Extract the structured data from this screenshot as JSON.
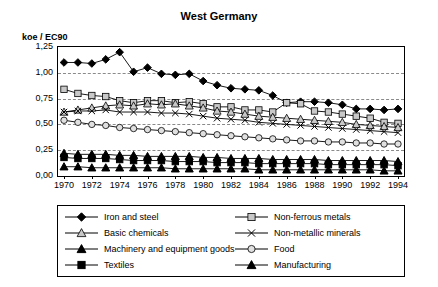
{
  "chart_data": {
    "type": "line",
    "title": "West Germany",
    "ylabel": "koe / EC90",
    "xlabel": "",
    "ylim": [
      0.0,
      1.25
    ],
    "yticks": [
      "0,00",
      "0,25",
      "0,50",
      "0,75",
      "1,00",
      "1,25"
    ],
    "ytick_values": [
      0.0,
      0.25,
      0.5,
      0.75,
      1.0,
      1.25
    ],
    "grid": true,
    "legend_position": "bottom",
    "x": [
      1970,
      1971,
      1972,
      1973,
      1974,
      1975,
      1976,
      1977,
      1978,
      1979,
      1980,
      1981,
      1982,
      1983,
      1984,
      1985,
      1986,
      1987,
      1988,
      1989,
      1990,
      1991,
      1992,
      1993,
      1994
    ],
    "xticks": [
      "1970",
      "1972",
      "1974",
      "1976",
      "1978",
      "1980",
      "1982",
      "1984",
      "1986",
      "1988",
      "1990",
      "1992",
      "1994"
    ],
    "series": [
      {
        "name": "Iron and steel",
        "marker": "diamond",
        "values": [
          1.1,
          1.1,
          1.09,
          1.13,
          1.2,
          1.01,
          1.05,
          0.99,
          0.98,
          0.99,
          0.92,
          0.88,
          0.85,
          0.84,
          0.83,
          0.78,
          0.71,
          0.72,
          0.72,
          0.71,
          0.69,
          0.65,
          0.65,
          0.64,
          0.65
        ]
      },
      {
        "name": "Non-ferrous metals",
        "marker": "square-light",
        "values": [
          0.84,
          0.8,
          0.78,
          0.77,
          0.73,
          0.71,
          0.73,
          0.73,
          0.71,
          0.72,
          0.7,
          0.67,
          0.67,
          0.64,
          0.64,
          0.62,
          0.71,
          0.7,
          0.63,
          0.62,
          0.6,
          0.58,
          0.56,
          0.52,
          0.51
        ]
      },
      {
        "name": "Basic chemicals",
        "marker": "triangle-light",
        "values": [
          0.62,
          0.64,
          0.66,
          0.68,
          0.69,
          0.68,
          0.7,
          0.69,
          0.7,
          0.68,
          0.66,
          0.63,
          0.62,
          0.6,
          0.58,
          0.57,
          0.56,
          0.55,
          0.54,
          0.53,
          0.52,
          0.5,
          0.49,
          0.48,
          0.47
        ]
      },
      {
        "name": "Non-metallic minerals",
        "marker": "x-cross",
        "values": [
          0.62,
          0.63,
          0.63,
          0.64,
          0.62,
          0.62,
          0.62,
          0.61,
          0.61,
          0.6,
          0.58,
          0.56,
          0.55,
          0.54,
          0.52,
          0.51,
          0.5,
          0.49,
          0.48,
          0.47,
          0.46,
          0.45,
          0.44,
          0.43,
          0.42
        ]
      },
      {
        "name": "Machinery and equipment goods",
        "marker": "triangle-up",
        "values": [
          0.22,
          0.21,
          0.21,
          0.21,
          0.2,
          0.2,
          0.19,
          0.19,
          0.19,
          0.19,
          0.18,
          0.18,
          0.17,
          0.17,
          0.17,
          0.16,
          0.16,
          0.16,
          0.16,
          0.15,
          0.15,
          0.15,
          0.15,
          0.15,
          0.14
        ]
      },
      {
        "name": "Food",
        "marker": "circle-light",
        "values": [
          0.54,
          0.52,
          0.5,
          0.49,
          0.47,
          0.46,
          0.45,
          0.44,
          0.43,
          0.42,
          0.41,
          0.4,
          0.39,
          0.38,
          0.37,
          0.36,
          0.35,
          0.34,
          0.34,
          0.33,
          0.33,
          0.32,
          0.32,
          0.31,
          0.31
        ]
      },
      {
        "name": "Textiles",
        "marker": "square-dark",
        "values": [
          0.18,
          0.17,
          0.17,
          0.17,
          0.16,
          0.15,
          0.15,
          0.15,
          0.14,
          0.14,
          0.14,
          0.13,
          0.13,
          0.13,
          0.12,
          0.12,
          0.12,
          0.12,
          0.12,
          0.11,
          0.11,
          0.11,
          0.11,
          0.11,
          0.1
        ]
      },
      {
        "name": "Manufacturing",
        "marker": "triangle-dark",
        "values": [
          0.09,
          0.09,
          0.08,
          0.08,
          0.08,
          0.08,
          0.08,
          0.08,
          0.07,
          0.07,
          0.07,
          0.07,
          0.07,
          0.07,
          0.06,
          0.06,
          0.06,
          0.06,
          0.06,
          0.06,
          0.06,
          0.06,
          0.06,
          0.05,
          0.05
        ]
      }
    ],
    "legend_order": [
      "Iron and steel",
      "Non-ferrous metals",
      "Basic chemicals",
      "Non-metallic minerals",
      "Machinery and equipment goods",
      "Food",
      "Textiles",
      "Manufacturing"
    ],
    "colors": {
      "line": "#000000",
      "grid": "#8a8a8a",
      "fill_light": "#c8c8c8",
      "fill_dark": "#000000",
      "background": "#ffffff"
    }
  }
}
